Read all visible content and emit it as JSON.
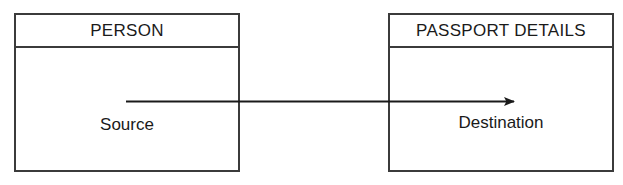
{
  "diagram": {
    "type": "data-flow-diagram",
    "canvas": {
      "width": 623,
      "height": 185,
      "background": "#ffffff"
    },
    "stroke_color": "#3b3b3b",
    "text_color": "#1a1a1a",
    "entities": [
      {
        "id": "person",
        "header": "PERSON",
        "role_label": "Source"
      },
      {
        "id": "passport",
        "header": "PASSPORT DETAILS",
        "role_label": "Destination"
      }
    ],
    "connector": {
      "name": "flow-arrow",
      "style": "solid-line-with-filled-arrowhead",
      "direction": "left-to-right",
      "from": "person",
      "to": "passport",
      "color": "#1a1a1a"
    }
  }
}
